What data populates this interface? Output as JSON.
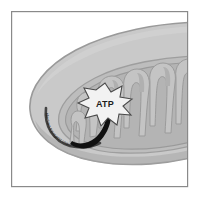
{
  "figure": {
    "style": "grayscale scientific illustration",
    "frame": {
      "present": true,
      "color": "#8a8a8a",
      "x": 11,
      "y": 11,
      "width": 177,
      "height": 176
    },
    "background_color": "#ffffff"
  },
  "labels": {
    "atp": "ATP",
    "electron_transport_chain": "electron transport chain"
  },
  "structures": [
    {
      "name": "outer-membrane",
      "label": "outer membrane",
      "fill": "#c9c9c9",
      "stroke": "#9a9a9a"
    },
    {
      "name": "inner-membrane",
      "label": "inner membrane",
      "fill": "#bdbdbd",
      "stroke": "#9e9e9e"
    },
    {
      "name": "matrix",
      "label": "matrix",
      "fill": "#b4b4b4",
      "stroke": "#9a9a9a"
    },
    {
      "name": "cristae",
      "label": "cristae",
      "count": 8,
      "fill": "#c4c4c4",
      "stroke": "#9b9b9b"
    }
  ],
  "annotations": {
    "atp_star": {
      "text": "ATP",
      "points": 8,
      "fill": "#f2f2f2",
      "stroke": "#4a4a4a",
      "center_x": 105,
      "center_y": 104
    },
    "flow_arrow": {
      "description": "curved arrow pointing up toward ATP",
      "color": "#111111"
    },
    "etc_arc": {
      "text": "electron transport chain",
      "description": "curved dark band with micro-text following the inner membrane",
      "color": "#2e2e2e"
    }
  },
  "colors": {
    "frame": "#8a8a8a",
    "outer_membrane": "#c9c9c9",
    "inner_membrane": "#bdbdbd",
    "matrix": "#b4b4b4",
    "crista": "#c4c4c4",
    "arrow": "#111111",
    "atp_fill": "#f2f2f2",
    "atp_text": "#1d1d1d",
    "background": "#ffffff"
  }
}
